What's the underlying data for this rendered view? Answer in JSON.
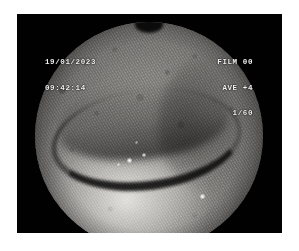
{
  "frame": {
    "background_color": "#ffffff",
    "border_color": "#010101",
    "modality": "endoscopy-still-frame"
  },
  "timestamp_overlay": {
    "date": "19/01/2023",
    "time": "09:42:14"
  },
  "camera_overlay": {
    "film": "FILM 00",
    "average": "AVE +4",
    "shutter": "1/60"
  },
  "field_of_view": {
    "shape": "circle",
    "text_color": "#f2f2f2"
  }
}
